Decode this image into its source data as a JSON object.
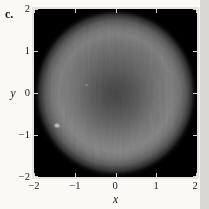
{
  "figure": {
    "panel_label": "c.",
    "background_color": "#faf9f6",
    "right_margin_color": "#d9d8d5",
    "frame_color": "#e5e4e1"
  },
  "axes": {
    "x": {
      "label": "x",
      "tick_labels": [
        "−2",
        "−1",
        "0",
        "1",
        "2"
      ]
    },
    "y": {
      "label": "y",
      "tick_labels": [
        "2",
        "1",
        "0",
        "−1",
        "−2"
      ]
    }
  },
  "chart_data": {
    "type": "heatmap",
    "title": "",
    "xlabel": "x",
    "ylabel": "y",
    "xlim": [
      -2,
      2
    ],
    "ylim": [
      -2,
      2
    ],
    "x_ticks": [
      -2,
      -1,
      0,
      1,
      2
    ],
    "y_ticks": [
      -2,
      -1,
      0,
      1,
      2
    ],
    "colormap": "grayscale",
    "background_intensity": 0,
    "pattern": "circularly symmetric disk of radius ~2 centered at origin; bright annulus near r≈1.2–1.5, darker center, smooth falloff to black by r≈2; plot corners black; subtle vertical striping noise",
    "radial_profile": {
      "radius": [
        0,
        0.4,
        0.8,
        1.2,
        1.5,
        1.7,
        1.85,
        1.95,
        2.0
      ],
      "intensity_0_255": [
        58,
        68,
        88,
        108,
        115,
        95,
        50,
        15,
        0
      ]
    },
    "features": [
      {
        "x": -1.44,
        "y": -0.76,
        "note": "small bright speck"
      },
      {
        "x": -0.7,
        "y": 0.2,
        "note": "faint bright speck"
      }
    ],
    "tick_style": "inward, white, all four sides",
    "legend": "none",
    "grid": "off"
  }
}
